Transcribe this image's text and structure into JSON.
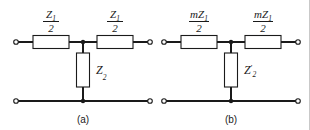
{
  "figure": {
    "background_color": "#ffffff",
    "line_color": "#1a1a1a",
    "border_color": "#c9c9c9"
  },
  "circuits": [
    {
      "id": "circuit-a",
      "caption": "(a)",
      "series_left": {
        "numerator": "Z",
        "numerator_sub": "1",
        "denominator": "2"
      },
      "series_right": {
        "numerator": "Z",
        "numerator_sub": "1",
        "denominator": "2"
      },
      "shunt": {
        "symbol": "Z",
        "sub": "2",
        "prime": ""
      }
    },
    {
      "id": "circuit-b",
      "caption": "(b)",
      "series_left": {
        "numerator": "mZ",
        "numerator_sub": "1",
        "denominator": "2"
      },
      "series_right": {
        "numerator": "mZ",
        "numerator_sub": "1",
        "denominator": "2"
      },
      "shunt": {
        "symbol": "Z",
        "sub": "2",
        "prime": "′"
      }
    }
  ]
}
